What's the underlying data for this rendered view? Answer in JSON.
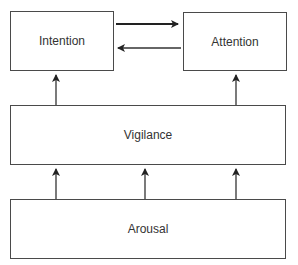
{
  "diagram": {
    "nodes": [
      {
        "id": "intention",
        "label": "Intention"
      },
      {
        "id": "attention",
        "label": "Attention"
      },
      {
        "id": "vigilance",
        "label": "Vigilance"
      },
      {
        "id": "arousal",
        "label": "Arousal"
      }
    ],
    "edges": [
      {
        "from": "intention",
        "to": "attention",
        "style": "bold"
      },
      {
        "from": "attention",
        "to": "intention",
        "style": "normal"
      },
      {
        "from": "vigilance",
        "to": "intention",
        "style": "normal"
      },
      {
        "from": "vigilance",
        "to": "attention",
        "style": "normal"
      },
      {
        "from": "arousal",
        "to": "vigilance",
        "style": "normal",
        "position": "left"
      },
      {
        "from": "arousal",
        "to": "vigilance",
        "style": "normal",
        "position": "center"
      },
      {
        "from": "arousal",
        "to": "vigilance",
        "style": "normal",
        "position": "right"
      }
    ]
  },
  "colors": {
    "line": "#4a4a4a",
    "text": "#333333",
    "background": "#ffffff"
  }
}
